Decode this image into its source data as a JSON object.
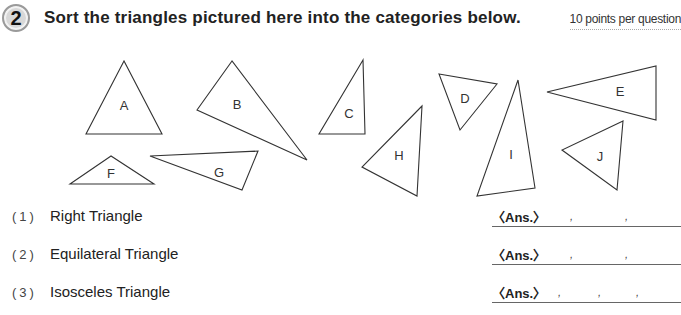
{
  "header": {
    "question_number": "2",
    "title": "Sort the triangles pictured here into the categories below.",
    "points": "10 points per question"
  },
  "figure": {
    "triangles": [
      {
        "label": "A",
        "points": "124,61 86,134 162,134",
        "label_x": 124,
        "label_y": 110
      },
      {
        "label": "B",
        "points": "232,61 197,110 307,160",
        "label_x": 237,
        "label_y": 109
      },
      {
        "label": "C",
        "points": "363,60 319,134 365,134",
        "label_x": 349,
        "label_y": 118
      },
      {
        "label": "D",
        "points": "439,74 497,84 460,130",
        "label_x": 465,
        "label_y": 103
      },
      {
        "label": "E",
        "points": "547,92 656,66 656,120",
        "label_x": 620,
        "label_y": 96
      },
      {
        "label": "F",
        "points": "111,156 70,184 154,184",
        "label_x": 111,
        "label_y": 178
      },
      {
        "label": "G",
        "points": "150,156 258,151 242,190",
        "label_x": 219,
        "label_y": 177
      },
      {
        "label": "H",
        "points": "422,106 362,167 417,196",
        "label_x": 399,
        "label_y": 160
      },
      {
        "label": "I",
        "points": "518,80 477,196 535,188",
        "label_x": 511,
        "label_y": 159
      },
      {
        "label": "J",
        "points": "623,121 562,150 617,190",
        "label_x": 600,
        "label_y": 161
      }
    ]
  },
  "questions": [
    {
      "number": "(1)",
      "label": "Right Triangle",
      "answer_tag": "〈Ans.〉",
      "commas": 2
    },
    {
      "number": "(2)",
      "label": "Equilateral Triangle",
      "answer_tag": "〈Ans.〉",
      "commas": 2
    },
    {
      "number": "(3)",
      "label": "Isosceles Triangle",
      "answer_tag": "〈Ans.〉",
      "commas": 3
    }
  ]
}
